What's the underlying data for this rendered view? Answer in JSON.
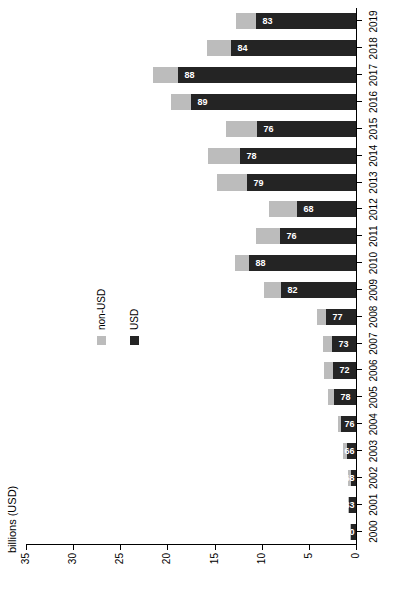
{
  "chart_data": {
    "type": "bar",
    "subtype": "stacked-horizontal",
    "title": "",
    "xlabel": "",
    "ylabel": "billions (USD)",
    "axis_title": "billions (USD)",
    "orientation": "horizontal-bars-rotated",
    "grid": false,
    "legend_position": "middle-left",
    "value_axis": {
      "label": "billions (USD)",
      "ticks": [
        0,
        5,
        10,
        15,
        20,
        25,
        30,
        35
      ],
      "tick_labels": [
        "0",
        "5",
        "10",
        "15",
        "20",
        "25",
        "30",
        "35"
      ],
      "range": [
        0,
        35
      ]
    },
    "categories": [
      "2000",
      "2001",
      "2002",
      "2003",
      "2004",
      "2005",
      "2006",
      "2007",
      "2008",
      "2009",
      "2010",
      "2011",
      "2012",
      "2013",
      "2014",
      "2015",
      "2016",
      "2017",
      "2018",
      "2019"
    ],
    "series": [
      {
        "name": "USD",
        "color": "#242424",
        "values": [
          0.55,
          0.75,
          0.55,
          0.95,
          1.55,
          2.35,
          2.45,
          2.55,
          3.15,
          8.0,
          11.3,
          8.1,
          6.3,
          11.6,
          12.3,
          10.5,
          17.5,
          18.9,
          13.3,
          10.6
        ]
      },
      {
        "name": "non-USD",
        "color": "#bcbcbc",
        "values": [
          0.05,
          0.15,
          0.25,
          0.45,
          0.4,
          0.6,
          0.95,
          0.9,
          0.95,
          1.75,
          1.55,
          2.55,
          2.95,
          3.1,
          3.4,
          3.3,
          2.15,
          2.6,
          2.55,
          2.15
        ]
      }
    ],
    "bar_labels": {
      "series": "USD",
      "unit": "%",
      "values": [
        "90",
        "83",
        "68",
        "66",
        "76",
        "78",
        "72",
        "73",
        "77",
        "82",
        "88",
        "76",
        "68",
        "79",
        "78",
        "76",
        "89",
        "88",
        "84",
        "83"
      ]
    },
    "legend": [
      {
        "label": "non-USD",
        "color": "#bcbcbc"
      },
      {
        "label": "USD",
        "color": "#242424"
      }
    ]
  }
}
